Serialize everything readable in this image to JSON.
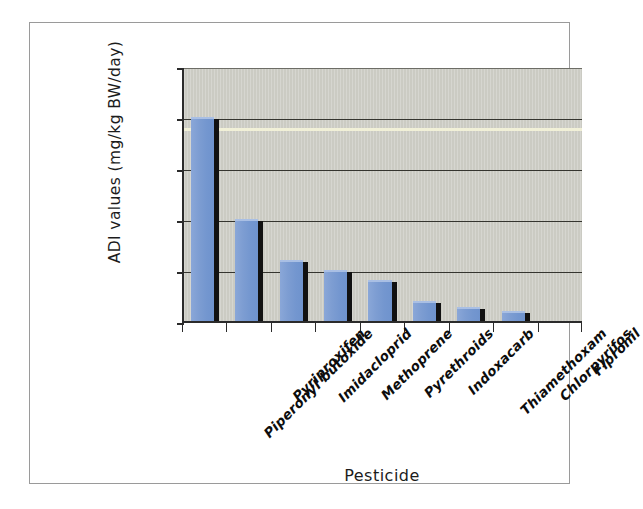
{
  "chart_data": {
    "type": "bar",
    "title": "",
    "xlabel": "Pesticide",
    "ylabel": "ADI values (mg/kg BW/day)",
    "categories": [
      "Piperonyl butoxide",
      "Pyriproxifen",
      "Imidacloprid",
      "Methoprene",
      "Pyrethroids",
      "Indoxacarb",
      "Thiamethoxam",
      "Chlorpyrifos",
      "Fipronil"
    ],
    "values": [
      0.2,
      0.1,
      0.06,
      0.05,
      0.04,
      0.02,
      0.014,
      0.01,
      0.0
    ],
    "ylim": [
      0,
      0.25
    ],
    "ytick_labels": [
      "0.25",
      "0.2",
      "0.15",
      "0.1",
      "0.05",
      "0"
    ],
    "ytick_values": [
      0.25,
      0.2,
      0.15,
      0.1,
      0.05,
      0
    ],
    "grid": true,
    "legend": "none",
    "bar_color": "#7d9dd2",
    "bar_shadow_color": "#111111",
    "plot_background": "#cbcbc3",
    "axis_color": "#2b2b2b",
    "figure_background": "#ffffff",
    "frame_color": "#9a9a9a"
  }
}
